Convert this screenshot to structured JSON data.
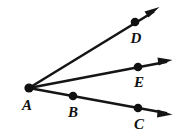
{
  "figure": {
    "background_color": "#ffffff",
    "stroke_color": "#151515",
    "dot_color": "#101010",
    "label_color": "#111111",
    "vertex": {
      "label": "A",
      "name": "vertex-a",
      "dot": {
        "cx": 29,
        "cy": 88,
        "r": 4.4
      },
      "label_pos": {
        "x": 27,
        "y": 110
      }
    },
    "rays": [
      {
        "name": "ray-ad",
        "from": "A",
        "through": "D",
        "start": {
          "x": 29,
          "y": 88
        },
        "end": {
          "x": 158,
          "y": 9
        },
        "arrow_tip": {
          "x": 158,
          "y": 9
        },
        "arrow_angle_deg": -31.5
      },
      {
        "name": "ray-ae",
        "from": "A",
        "through": "E",
        "start": {
          "x": 29,
          "y": 88
        },
        "end": {
          "x": 171,
          "y": 61
        },
        "arrow_tip": {
          "x": 171,
          "y": 61
        },
        "arrow_angle_deg": -10.8
      },
      {
        "name": "ray-abc",
        "from": "A",
        "through": "B, C",
        "start": {
          "x": 29,
          "y": 88
        },
        "end": {
          "x": 171,
          "y": 114
        },
        "arrow_tip": {
          "x": 171,
          "y": 114
        },
        "arrow_angle_deg": 10.4
      }
    ],
    "points": [
      {
        "label": "D",
        "name": "point-d",
        "on_ray": "ray-ad",
        "dot": {
          "cx": 135,
          "cy": 22,
          "r": 4.2
        },
        "label_pos": {
          "x": 136,
          "y": 43
        }
      },
      {
        "label": "E",
        "name": "point-e",
        "on_ray": "ray-ae",
        "dot": {
          "cx": 138,
          "cy": 67,
          "r": 4.2
        },
        "label_pos": {
          "x": 139,
          "y": 87
        }
      },
      {
        "label": "B",
        "name": "point-b",
        "on_ray": "ray-abc",
        "dot": {
          "cx": 73,
          "cy": 96,
          "r": 4.2
        },
        "label_pos": {
          "x": 73,
          "y": 117
        }
      },
      {
        "label": "C",
        "name": "point-c",
        "on_ray": "ray-abc",
        "dot": {
          "cx": 138,
          "cy": 108,
          "r": 4.2
        },
        "label_pos": {
          "x": 139,
          "y": 129
        }
      }
    ]
  }
}
